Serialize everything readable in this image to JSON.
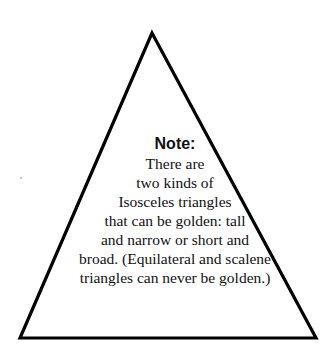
{
  "diagram": {
    "shape": "triangle",
    "stroke_color": "#000000",
    "fill_color": "#ffffff",
    "note": {
      "title": "Note:",
      "lines": [
        "There are",
        "two kinds of",
        "Isosceles triangles",
        "that can be golden: tall",
        "and narrow or short and",
        "broad. (Equilateral and scalene",
        "triangles can never be golden.)"
      ]
    }
  }
}
